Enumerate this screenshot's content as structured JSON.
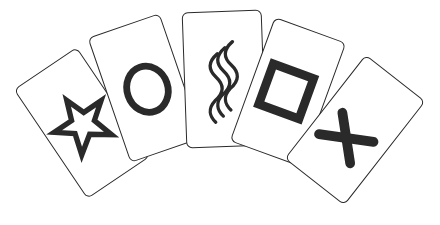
{
  "title": "Zener cards",
  "ink_color": "#2a2a2a",
  "cards": [
    {
      "symbol": "star",
      "label": "Star card"
    },
    {
      "symbol": "circle",
      "label": "Circle card"
    },
    {
      "symbol": "waves",
      "label": "Wavy lines card"
    },
    {
      "symbol": "square",
      "label": "Square card"
    },
    {
      "symbol": "cross",
      "label": "Cross card"
    }
  ]
}
